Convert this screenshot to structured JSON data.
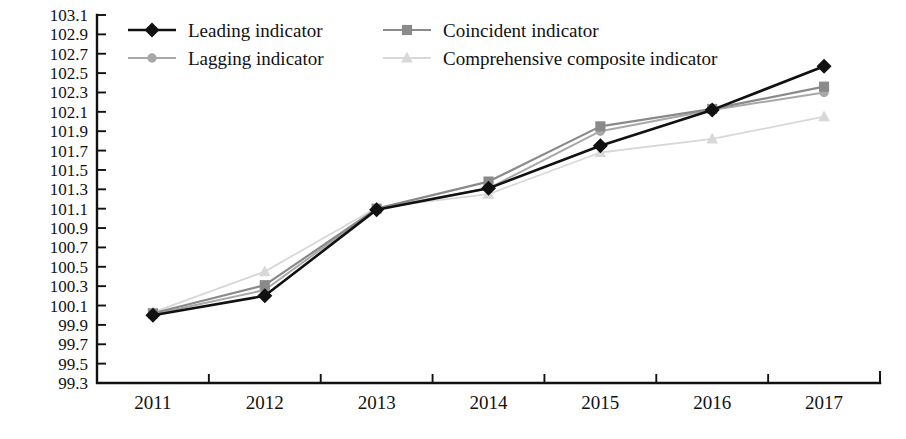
{
  "chart_data": {
    "type": "line",
    "title": "",
    "subtitle": "",
    "xlabel": "",
    "ylabel": "",
    "categories": [
      "2011",
      "2012",
      "2013",
      "2014",
      "2015",
      "2016",
      "2017"
    ],
    "x": [
      2011,
      2012,
      2013,
      2014,
      2015,
      2016,
      2017
    ],
    "ylim": [
      99.3,
      103.1
    ],
    "ytick_step": 0.2,
    "ytick_labels": [
      "103.1",
      "102.9",
      "102.7",
      "102.5",
      "102.3",
      "102.1",
      "101.9",
      "101.7",
      "101.5",
      "101.3",
      "101.1",
      "100.9",
      "100.7",
      "100.5",
      "100.3",
      "100.1",
      "99.9",
      "99.7",
      "99.5",
      "99.3"
    ],
    "ytick_values": [
      103.1,
      102.9,
      102.7,
      102.5,
      102.3,
      102.1,
      101.9,
      101.7,
      101.5,
      101.3,
      101.1,
      100.9,
      100.7,
      100.5,
      100.3,
      100.1,
      99.9,
      99.7,
      99.5,
      99.3
    ],
    "grid": false,
    "legend_position": "top-left",
    "series": [
      {
        "name": "Leading indicator",
        "marker": "diamond",
        "color": "#111111",
        "line_width": 2.6,
        "marker_size": 7.5,
        "values": [
          100.0,
          100.2,
          101.09,
          101.31,
          101.75,
          102.12,
          102.57
        ]
      },
      {
        "name": "Coincident indicator",
        "marker": "square",
        "color": "#8a8a8a",
        "line_width": 2.2,
        "marker_size": 6.5,
        "values": [
          100.02,
          100.31,
          101.1,
          101.38,
          101.95,
          102.13,
          102.36
        ]
      },
      {
        "name": "Lagging indicator",
        "marker": "circle",
        "color": "#a8a8a8",
        "line_width": 2.0,
        "marker_size": 6.0,
        "values": [
          100.01,
          100.26,
          101.1,
          101.31,
          101.9,
          102.12,
          102.3
        ]
      },
      {
        "name": "Comprehensive composite indicator",
        "marker": "triangle",
        "color": "#d8d8d8",
        "line_width": 1.8,
        "marker_size": 6.5,
        "values": [
          100.03,
          100.45,
          101.11,
          101.25,
          101.68,
          101.82,
          102.05
        ]
      }
    ],
    "legend_order": [
      "Leading indicator",
      "Coincident indicator",
      "Lagging indicator",
      "Comprehensive composite indicator"
    ]
  },
  "colors": {
    "axis": "#111111",
    "background": "#ffffff",
    "leading": "#111111",
    "coincident": "#8a8a8a",
    "lagging": "#a8a8a8",
    "comprehensive": "#d8d8d8"
  }
}
